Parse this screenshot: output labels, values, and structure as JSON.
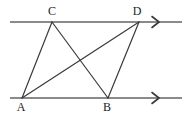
{
  "figure": {
    "kind": "geometry-diagram",
    "background_color": "#ffffff",
    "parallel_line_color": "#8a8a8a",
    "segment_color": "#3a3a3a",
    "label_color": "#1c1c1c",
    "parallel_lines": [
      {
        "name": "upper-parallel-line",
        "x1": 10,
        "y1": 22,
        "x2": 182,
        "y2": 22,
        "arrow_marker": "single-chevron-right",
        "arrow_x": 152
      },
      {
        "name": "lower-parallel-line",
        "x1": 10,
        "y1": 98,
        "x2": 182,
        "y2": 98,
        "arrow_marker": "single-chevron-right",
        "arrow_x": 152
      }
    ],
    "vertices": [
      {
        "id": "C",
        "label": "C",
        "x": 52,
        "y": 22,
        "label_x": 44,
        "label_y": 5
      },
      {
        "id": "D",
        "label": "D",
        "x": 139,
        "y": 22,
        "label_x": 129,
        "label_y": 5
      },
      {
        "id": "A",
        "label": "A",
        "x": 22,
        "y": 98,
        "label_x": 13,
        "label_y": 101
      },
      {
        "id": "B",
        "label": "B",
        "x": 108,
        "y": 98,
        "label_x": 99,
        "label_y": 101
      }
    ],
    "segments": [
      {
        "id": "AC",
        "name": "segment-a-c",
        "x1": 22,
        "y1": 98,
        "x2": 52,
        "y2": 22
      },
      {
        "id": "AD",
        "name": "segment-a-d",
        "x1": 22,
        "y1": 98,
        "x2": 139,
        "y2": 22
      },
      {
        "id": "CB",
        "name": "segment-c-b",
        "x1": 52,
        "y1": 22,
        "x2": 108,
        "y2": 98
      },
      {
        "id": "BD",
        "name": "segment-b-d",
        "x1": 108,
        "y1": 98,
        "x2": 139,
        "y2": 22
      }
    ]
  }
}
